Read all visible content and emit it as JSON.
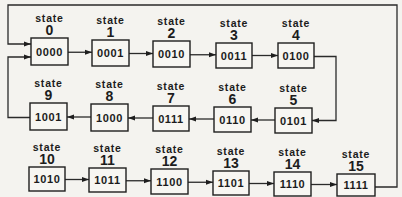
{
  "diagram": {
    "title": "",
    "state_word": "state",
    "colors": {
      "line": "#2a2a2a",
      "box_border": "#1e1e1e",
      "background": "#f4f3ef",
      "text": "#1c1c1c"
    },
    "states": [
      {
        "id": 0,
        "label": "state",
        "number": "0",
        "code": "0000",
        "x": 31,
        "y": 38,
        "w": 37,
        "h": 27
      },
      {
        "id": 1,
        "label": "state",
        "number": "1",
        "code": "0001",
        "x": 92,
        "y": 40,
        "w": 37,
        "h": 26
      },
      {
        "id": 2,
        "label": "state",
        "number": "2",
        "code": "0010",
        "x": 153,
        "y": 41,
        "w": 37,
        "h": 26
      },
      {
        "id": 3,
        "label": "state",
        "number": "3",
        "code": "0011",
        "x": 216,
        "y": 43,
        "w": 36,
        "h": 25
      },
      {
        "id": 4,
        "label": "state",
        "number": "4",
        "code": "0100",
        "x": 278,
        "y": 43,
        "w": 36,
        "h": 25
      },
      {
        "id": 5,
        "label": "state",
        "number": "5",
        "code": "0101",
        "x": 275,
        "y": 108,
        "w": 37,
        "h": 25
      },
      {
        "id": 6,
        "label": "state",
        "number": "6",
        "code": "0110",
        "x": 214,
        "y": 107,
        "w": 37,
        "h": 25
      },
      {
        "id": 7,
        "label": "state",
        "number": "7",
        "code": "0111",
        "x": 153,
        "y": 106,
        "w": 36,
        "h": 25
      },
      {
        "id": 8,
        "label": "state",
        "number": "8",
        "code": "1000",
        "x": 91,
        "y": 104,
        "w": 37,
        "h": 27
      },
      {
        "id": 9,
        "label": "state",
        "number": "9",
        "code": "1001",
        "x": 30,
        "y": 103,
        "w": 37,
        "h": 27
      },
      {
        "id": 10,
        "label": "state",
        "number": "10",
        "code": "1010",
        "x": 29,
        "y": 167,
        "w": 36,
        "h": 24
      },
      {
        "id": 11,
        "label": "state",
        "number": "11",
        "code": "1011",
        "x": 89,
        "y": 168,
        "w": 37,
        "h": 24
      },
      {
        "id": 12,
        "label": "state",
        "number": "12",
        "code": "1100",
        "x": 151,
        "y": 169,
        "w": 37,
        "h": 25
      },
      {
        "id": 13,
        "label": "state",
        "number": "13",
        "code": "1101",
        "x": 213,
        "y": 171,
        "w": 36,
        "h": 24
      },
      {
        "id": 14,
        "label": "state",
        "number": "14",
        "code": "1110",
        "x": 274,
        "y": 172,
        "w": 37,
        "h": 24
      },
      {
        "id": 15,
        "label": "state",
        "number": "15",
        "code": "1111",
        "x": 337,
        "y": 174,
        "w": 38,
        "h": 22
      }
    ],
    "transitions": [
      {
        "from": 0,
        "to": 1
      },
      {
        "from": 1,
        "to": 2
      },
      {
        "from": 2,
        "to": 3
      },
      {
        "from": 3,
        "to": 4
      },
      {
        "from": 4,
        "to": 5
      },
      {
        "from": 5,
        "to": 6
      },
      {
        "from": 6,
        "to": 7
      },
      {
        "from": 7,
        "to": 8
      },
      {
        "from": 8,
        "to": 9
      },
      {
        "from": 9,
        "to": 0
      },
      {
        "from": 10,
        "to": 11
      },
      {
        "from": 11,
        "to": 12
      },
      {
        "from": 12,
        "to": 13
      },
      {
        "from": 13,
        "to": 14
      },
      {
        "from": 14,
        "to": 15
      },
      {
        "from": 15,
        "to": 0
      }
    ]
  }
}
